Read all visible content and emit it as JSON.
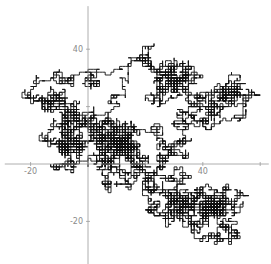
{
  "chart_data": {
    "type": "line",
    "title": "",
    "subtitle": "",
    "xlabel": "",
    "ylabel": "",
    "xlim": [
      -29,
      63
    ],
    "ylim": [
      -35,
      55
    ],
    "x_ticks": [
      {
        "value": -20,
        "label": "-20"
      },
      {
        "value": 0,
        "label": ""
      },
      {
        "value": 20,
        "label": ""
      },
      {
        "value": 40,
        "label": "40"
      },
      {
        "value": 60,
        "label": ""
      }
    ],
    "y_ticks": [
      {
        "value": -20,
        "label": "-20"
      },
      {
        "value": 0,
        "label": ""
      },
      {
        "value": 20,
        "label": ""
      },
      {
        "value": 40,
        "label": "40"
      }
    ],
    "grid": false,
    "legend": null,
    "series": [
      {
        "name": "random walk",
        "color": "#111111",
        "step": 1,
        "approx_bounds": {
          "xmin": -27,
          "xmax": 60,
          "ymin": -28,
          "ymax": 51
        },
        "dense_clusters": [
          {
            "x": 30,
            "y": 28
          },
          {
            "x": 50,
            "y": 25
          },
          {
            "x": -8,
            "y": 7
          },
          {
            "x": 10,
            "y": 7
          },
          {
            "x": 30,
            "y": -13
          },
          {
            "x": 44,
            "y": -15
          },
          {
            "x": -14,
            "y": 22
          }
        ]
      }
    ]
  },
  "axes": {
    "color": "#9a9a9a",
    "origin_px": {
      "x": 88,
      "y": 164
    },
    "px_per_unit": 2.87
  }
}
